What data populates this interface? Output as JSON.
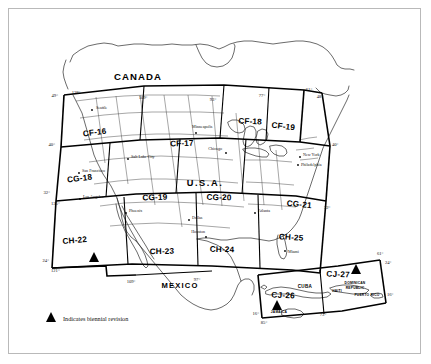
{
  "document": {
    "title": "Sectional Chart Index Map",
    "frame_border_color": "#b9b9b9",
    "background_color": "#ffffff",
    "ink_color": "#000000"
  },
  "legend": {
    "marker_icon": "triangle-icon",
    "text": "Indicates biennial revision"
  },
  "countries": [
    {
      "name": "CANADA",
      "x": 138,
      "y": 80
    },
    {
      "name": "U.S.A.",
      "x": 205,
      "y": 186
    },
    {
      "name": "MEXICO",
      "x": 180,
      "y": 288
    }
  ],
  "zones": [
    {
      "id": "CF-16",
      "x": 95,
      "y": 135,
      "rot": -7,
      "biennial": false
    },
    {
      "id": "CF-17",
      "x": 182,
      "y": 146,
      "rot": -2,
      "biennial": false
    },
    {
      "id": "CF-18",
      "x": 250,
      "y": 124,
      "rot": 3,
      "biennial": false
    },
    {
      "id": "CF-19",
      "x": 283,
      "y": 129,
      "rot": 7,
      "biennial": false
    },
    {
      "id": "CG-18",
      "x": 80,
      "y": 181,
      "rot": -7,
      "biennial": false
    },
    {
      "id": "CG-19",
      "x": 155,
      "y": 200,
      "rot": -2,
      "biennial": false
    },
    {
      "id": "CG-20",
      "x": 219,
      "y": 200,
      "rot": 1,
      "biennial": false
    },
    {
      "id": "CG-21",
      "x": 299,
      "y": 207,
      "rot": 6,
      "biennial": false
    },
    {
      "id": "CH-22",
      "x": 75,
      "y": 243,
      "rot": -5,
      "biennial": true
    },
    {
      "id": "CH-23",
      "x": 162,
      "y": 254,
      "rot": -1,
      "biennial": false
    },
    {
      "id": "CH-24",
      "x": 222,
      "y": 252,
      "rot": 1,
      "biennial": false
    },
    {
      "id": "CH-25",
      "x": 291,
      "y": 240,
      "rot": 4,
      "biennial": false
    },
    {
      "id": "CJ-26",
      "x": 283,
      "y": 298,
      "rot": 2,
      "biennial": true
    },
    {
      "id": "CJ-27",
      "x": 338,
      "y": 277,
      "rot": 2,
      "biennial": true
    }
  ],
  "zone_triangles": [
    {
      "zone": "CH-22",
      "x": 94,
      "y": 258
    },
    {
      "zone": "CJ-26",
      "x": 277,
      "y": 306
    },
    {
      "zone": "CJ-27",
      "x": 356,
      "y": 270
    }
  ],
  "cities": [
    {
      "name": "Seattle",
      "x": 96,
      "y": 109,
      "dot_x": 92,
      "dot_y": 110
    },
    {
      "name": "Salt Lake City",
      "x": 131,
      "y": 158,
      "dot_x": 128,
      "dot_y": 159
    },
    {
      "name": "San Francisco",
      "x": 82,
      "y": 172,
      "dot_x": 79,
      "dot_y": 173
    },
    {
      "name": "Los Angeles",
      "x": 83,
      "y": 198,
      "dot_x": 80,
      "dot_y": 199
    },
    {
      "name": "Phoenix",
      "x": 129,
      "y": 212,
      "dot_x": 126,
      "dot_y": 213
    },
    {
      "name": "Minneapolis",
      "x": 192,
      "y": 128,
      "dot_x": 196,
      "dot_y": 133
    },
    {
      "name": "Chicago",
      "x": 222,
      "y": 150,
      "dot_x": 226,
      "dot_y": 153
    },
    {
      "name": "Dallas",
      "x": 192,
      "y": 219,
      "dot_x": 189,
      "dot_y": 220
    },
    {
      "name": "Houston",
      "x": 205,
      "y": 233,
      "dot_x": 206,
      "dot_y": 237
    },
    {
      "name": "Atlanta",
      "x": 258,
      "y": 212,
      "dot_x": 255,
      "dot_y": 213
    },
    {
      "name": "Miami",
      "x": 288,
      "y": 253,
      "dot_x": 285,
      "dot_y": 251
    },
    {
      "name": "Philadelphia",
      "x": 301,
      "y": 166,
      "dot_x": 298,
      "dot_y": 165
    },
    {
      "name": "New York",
      "x": 303,
      "y": 156,
      "dot_x": 300,
      "dot_y": 157
    }
  ],
  "islands": [
    {
      "name": "CUBA",
      "x": 305,
      "y": 288,
      "size": "lg"
    },
    {
      "name": "JAMAICA",
      "x": 279,
      "y": 313,
      "size": "sm"
    },
    {
      "name": "DOMINICAN",
      "x": 355,
      "y": 284,
      "size": "sm"
    },
    {
      "name": "REPUBLIC",
      "x": 355,
      "y": 289,
      "size": "sm"
    },
    {
      "name": "PUERTO RICO",
      "x": 367,
      "y": 296,
      "size": "sm"
    },
    {
      "name": "HAITI",
      "x": 337,
      "y": 292,
      "size": "sm"
    }
  ],
  "coordinates": {
    "top": [
      {
        "label": "128°",
        "x": 76,
        "y": 94
      },
      {
        "label": "109°",
        "x": 143,
        "y": 99
      },
      {
        "label": "93°",
        "x": 213,
        "y": 101
      },
      {
        "label": "77°",
        "x": 262,
        "y": 97
      },
      {
        "label": "61°",
        "x": 309,
        "y": 91
      },
      {
        "label": "48°",
        "x": 320,
        "y": 98
      }
    ],
    "left": [
      {
        "label": "49°",
        "x": 58,
        "y": 97
      },
      {
        "label": "40°",
        "x": 55,
        "y": 146
      },
      {
        "label": "32°",
        "x": 50,
        "y": 194
      },
      {
        "label": "135°",
        "x": 51,
        "y": 203
      },
      {
        "label": "24°",
        "x": 49,
        "y": 262
      },
      {
        "label": "121°",
        "x": 51,
        "y": 270
      }
    ],
    "right": [
      {
        "label": "40°",
        "x": 332,
        "y": 146
      },
      {
        "label": "32°",
        "x": 324,
        "y": 209
      },
      {
        "label": "61°",
        "x": 377,
        "y": 255
      },
      {
        "label": "24°",
        "x": 385,
        "y": 264
      },
      {
        "label": "16°",
        "x": 387,
        "y": 296
      }
    ],
    "bottom": [
      {
        "label": "109°",
        "x": 131,
        "y": 283
      },
      {
        "label": "97°",
        "x": 197,
        "y": 281
      },
      {
        "label": "16°",
        "x": 259,
        "y": 315
      },
      {
        "label": "85°",
        "x": 264,
        "y": 322
      },
      {
        "label": "73°",
        "x": 323,
        "y": 316
      }
    ]
  }
}
